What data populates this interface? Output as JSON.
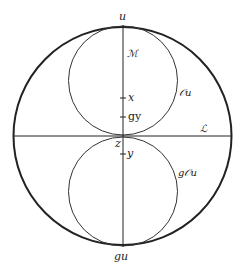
{
  "diagram": {
    "labels": {
      "top_point": "u",
      "bottom_point": "gu",
      "vertical_line": "ℳ",
      "horizontal_line": "ℒ",
      "upper_circle": "𝒪u",
      "lower_circle": "g𝒪u",
      "point_x": "x",
      "point_gy": "gy",
      "point_z": "z",
      "point_y": "y"
    },
    "geometry": {
      "outer_circle": {
        "cx": 122.5,
        "cy": 136,
        "r": 109
      },
      "upper_circle": {
        "cx": 123,
        "cy": 80,
        "r": 54
      },
      "lower_circle": {
        "cx": 123,
        "cy": 191,
        "r": 54
      },
      "vertical_line_x": 123,
      "horizontal_line_y": 136,
      "ticks_y": [
        98,
        117,
        154
      ]
    },
    "colors": {
      "stroke": "#222222",
      "background": "#ffffff"
    }
  }
}
